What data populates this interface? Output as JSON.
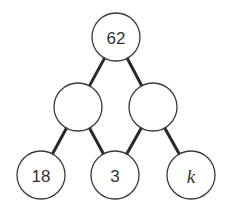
{
  "diagram": {
    "type": "number-pyramid-tree",
    "colors": {
      "edge": "#2a2a2a",
      "node_stroke": "#3a3a3a",
      "node_fill": "#ffffff",
      "text": "#333333"
    },
    "nodes": [
      {
        "id": "top",
        "label": "62",
        "cx": 116,
        "cy": 37,
        "r": 24,
        "italic": false
      },
      {
        "id": "middle-left",
        "label": "",
        "cx": 78,
        "cy": 107,
        "r": 24,
        "italic": false
      },
      {
        "id": "middle-right",
        "label": "",
        "cx": 153,
        "cy": 107,
        "r": 24,
        "italic": false
      },
      {
        "id": "bottom-left",
        "label": "18",
        "cx": 41,
        "cy": 175,
        "r": 24,
        "italic": false
      },
      {
        "id": "bottom-middle",
        "label": "3",
        "cx": 115,
        "cy": 175,
        "r": 24,
        "italic": false
      },
      {
        "id": "bottom-right",
        "label": "k",
        "cx": 191,
        "cy": 175,
        "r": 24,
        "italic": true
      }
    ],
    "edges": [
      {
        "from": "top",
        "to": "middle-left"
      },
      {
        "from": "top",
        "to": "middle-right"
      },
      {
        "from": "middle-left",
        "to": "bottom-left"
      },
      {
        "from": "middle-left",
        "to": "bottom-middle"
      },
      {
        "from": "middle-right",
        "to": "bottom-middle"
      },
      {
        "from": "middle-right",
        "to": "bottom-right"
      }
    ]
  }
}
